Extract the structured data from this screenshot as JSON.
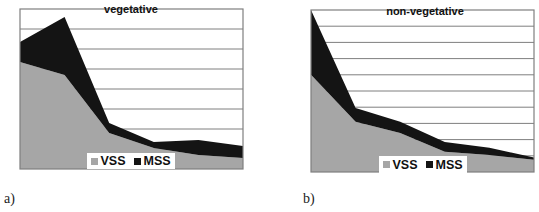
{
  "chart_data": [
    {
      "type": "area",
      "stacked": true,
      "panel_label": "a)",
      "title": "vegetative",
      "xlabel": "",
      "ylabel": "",
      "x": [
        1,
        2,
        3,
        4,
        5,
        6
      ],
      "ylim": [
        0,
        8
      ],
      "grid": true,
      "gridlines": 8,
      "legend_position": "bottom-inside",
      "series": [
        {
          "name": "VSS",
          "color": "#a6a6a6",
          "values": [
            5.35,
            4.7,
            1.8,
            1.05,
            0.7,
            0.55
          ]
        },
        {
          "name": "MSS",
          "color": "#141414",
          "values": [
            1.0,
            2.9,
            0.5,
            0.3,
            0.75,
            0.6
          ]
        }
      ]
    },
    {
      "type": "area",
      "stacked": true,
      "panel_label": "b)",
      "title": "non-vegetative",
      "xlabel": "",
      "ylabel": "",
      "x": [
        1,
        2,
        3,
        4,
        5,
        6
      ],
      "ylim": [
        0,
        10
      ],
      "grid": true,
      "gridlines": 10,
      "legend_position": "bottom-inside",
      "series": [
        {
          "name": "VSS",
          "color": "#a6a6a6",
          "values": [
            6.0,
            3.1,
            2.4,
            1.25,
            1.05,
            0.75
          ]
        },
        {
          "name": "MSS",
          "color": "#141414",
          "values": [
            4.0,
            0.85,
            0.7,
            0.6,
            0.45,
            0.15
          ]
        }
      ]
    }
  ],
  "panels": {
    "a": {
      "label": "a)",
      "title": "vegetative",
      "legend": [
        "VSS",
        "MSS"
      ]
    },
    "b": {
      "label": "b)",
      "title": "non-vegetative",
      "legend": [
        "VSS",
        "MSS"
      ]
    }
  },
  "colors": {
    "vss": "#a6a6a6",
    "mss": "#141414",
    "grid": "#7f7f7f",
    "border": "#7f7f7f"
  }
}
